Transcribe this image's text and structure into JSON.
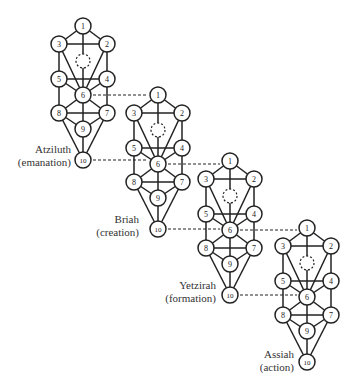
{
  "diagram": {
    "node_radius": 8,
    "stroke_color": "#222222",
    "base_nodes": [
      {
        "id": "1",
        "x": 83,
        "y": 26
      },
      {
        "id": "2",
        "x": 107,
        "y": 44
      },
      {
        "id": "3",
        "x": 59,
        "y": 44
      },
      {
        "id": "4",
        "x": 107,
        "y": 79
      },
      {
        "id": "5",
        "x": 59,
        "y": 79
      },
      {
        "id": "6",
        "x": 83,
        "y": 95
      },
      {
        "id": "7",
        "x": 107,
        "y": 113
      },
      {
        "id": "8",
        "x": 59,
        "y": 113
      },
      {
        "id": "9",
        "x": 83,
        "y": 129
      },
      {
        "id": "10",
        "x": 83,
        "y": 160
      }
    ],
    "daat": {
      "x": 83,
      "y": 61,
      "r": 7,
      "style": "dashed"
    },
    "edges": [
      [
        "1",
        "2"
      ],
      [
        "1",
        "3"
      ],
      [
        "1",
        "6"
      ],
      [
        "2",
        "3"
      ],
      [
        "2",
        "4"
      ],
      [
        "2",
        "6"
      ],
      [
        "3",
        "5"
      ],
      [
        "3",
        "6"
      ],
      [
        "4",
        "5"
      ],
      [
        "4",
        "6"
      ],
      [
        "5",
        "6"
      ],
      [
        "4",
        "7"
      ],
      [
        "5",
        "8"
      ],
      [
        "6",
        "7"
      ],
      [
        "6",
        "8"
      ],
      [
        "6",
        "9"
      ],
      [
        "7",
        "8"
      ],
      [
        "7",
        "9"
      ],
      [
        "8",
        "9"
      ],
      [
        "7",
        "10"
      ],
      [
        "8",
        "10"
      ],
      [
        "9",
        "10"
      ]
    ],
    "worlds": [
      {
        "name": "Atziluth",
        "meaning": "(emanation)",
        "dx": 0,
        "dy": 0,
        "label_right": 71,
        "label_top": 143
      },
      {
        "name": "Briah",
        "meaning": "(creation)",
        "dx": 75,
        "dy": 69,
        "label_right": 139,
        "label_top": 213
      },
      {
        "name": "Yetzirah",
        "meaning": "(formation)",
        "dx": 147,
        "dy": 135,
        "label_right": 216,
        "label_top": 279
      },
      {
        "name": "Assiah",
        "meaning": "(action)",
        "dx": 224,
        "dy": 202,
        "label_right": 294,
        "label_top": 348
      }
    ],
    "connectors": [
      {
        "from_world": 0,
        "from_node": "6",
        "to_world": 1,
        "to_node": "1"
      },
      {
        "from_world": 0,
        "from_node": "10",
        "to_world": 1,
        "to_node": "6"
      },
      {
        "from_world": 1,
        "from_node": "6",
        "to_world": 2,
        "to_node": "1"
      },
      {
        "from_world": 1,
        "from_node": "10",
        "to_world": 2,
        "to_node": "6"
      },
      {
        "from_world": 2,
        "from_node": "6",
        "to_world": 3,
        "to_node": "1"
      },
      {
        "from_world": 2,
        "from_node": "10",
        "to_world": 3,
        "to_node": "6"
      }
    ]
  }
}
